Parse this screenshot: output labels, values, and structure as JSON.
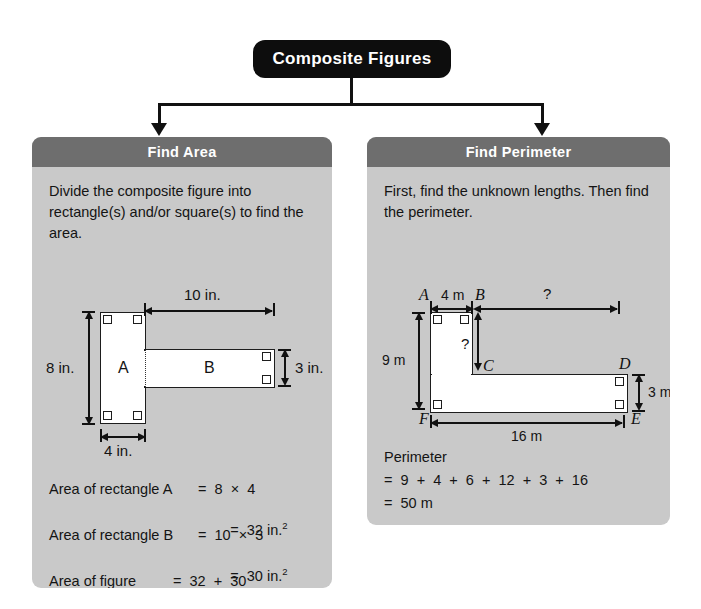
{
  "title": "Composite Figures",
  "panels": {
    "area": {
      "header": "Find Area",
      "intro": "Divide the composite figure into rectangle(s) and/or square(s) to find the area.",
      "figure": {
        "label_a": "A",
        "label_b": "B",
        "dim_height": "8 in.",
        "dim_width_a": "4 in.",
        "dim_width_b": "10 in.",
        "dim_height_b": "3 in."
      },
      "calc": {
        "line1_label": "Area of rectangle A",
        "line1_expr": "=  8  ×  4",
        "line2_expr": "=  32 in.",
        "line2_sup": "2",
        "line3_label": "Area of rectangle B",
        "line3_expr": "=  10  ×  3",
        "line4_expr": "=  30 in.",
        "line4_sup": "2",
        "line5_label": "Area of figure",
        "line5_expr": "=  32  +  30",
        "line6_expr": "=  62 in.",
        "line6_sup": "2"
      }
    },
    "perimeter": {
      "header": "Find Perimeter",
      "intro": "First, find the unknown lengths. Then find the perimeter.",
      "figure": {
        "vertex_a": "A",
        "vertex_b": "B",
        "vertex_c": "C",
        "vertex_d": "D",
        "vertex_e": "E",
        "vertex_f": "F",
        "dim_top_known": "4 m",
        "dim_top_unknown": "?",
        "dim_left": "9 m",
        "dim_inner_unknown": "?",
        "dim_right": "3 m",
        "dim_bottom": "16 m"
      },
      "calc": {
        "line1": "Perimeter",
        "line2": "=  9  +  4  +  6  +  12  +  3  +  16",
        "line3": "=  50 m"
      }
    }
  },
  "colors": {
    "title_bg": "#0d0d0d",
    "panel_header_bg": "#6e6e6e",
    "panel_body_bg": "#c9c9c9",
    "shape_fill": "#ffffff",
    "stroke": "#1d1d1d",
    "page_bg": "#ffffff"
  }
}
